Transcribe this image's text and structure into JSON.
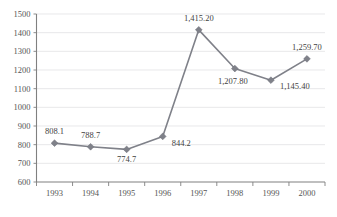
{
  "chart_data": {
    "type": "line",
    "title": "",
    "subtitle": "",
    "xlabel": "",
    "ylabel": "",
    "categories": [
      "1993",
      "1994",
      "1995",
      "1996",
      "1997",
      "1998",
      "1999",
      "2000"
    ],
    "x": [
      "1993",
      "1994",
      "1995",
      "1996",
      "1997",
      "1998",
      "1999",
      "2000"
    ],
    "values": [
      808.1,
      788.7,
      774.7,
      844.2,
      1415.2,
      1207.8,
      1145.4,
      1259.7
    ],
    "data_labels": [
      "808.1",
      "788.7",
      "774.7",
      "844.2",
      "1,415.20",
      "1,207.80",
      "1,145.40",
      "1,259.70"
    ],
    "series": [
      {
        "name": "",
        "values": [
          808.1,
          788.7,
          774.7,
          844.2,
          1415.2,
          1207.8,
          1145.4,
          1259.7
        ]
      }
    ],
    "ylim": [
      600,
      1500
    ],
    "ytick_labels": [
      "1500",
      "1400",
      "1300",
      "1200",
      "1100",
      "1000",
      "900",
      "800",
      "700",
      "600"
    ],
    "ytick_values": [
      1500,
      1400,
      1300,
      1200,
      1100,
      1000,
      900,
      800,
      700,
      600
    ],
    "ytick_step": 100,
    "grid": true,
    "grid_axis": "y",
    "legend": false,
    "legend_position": "none",
    "marker": "diamond",
    "series_color": "#7f8189",
    "grid_color": "#d8d8dc",
    "axis_color": "#808080",
    "label_color": "#3f3f3f",
    "background_color": "#ffffff",
    "annotations": []
  },
  "axes": {
    "y": {
      "ticks": [
        {
          "label": "1500",
          "value": 1500
        },
        {
          "label": "1400",
          "value": 1400
        },
        {
          "label": "1300",
          "value": 1300
        },
        {
          "label": "1200",
          "value": 1200
        },
        {
          "label": "1100",
          "value": 1100
        },
        {
          "label": "1000",
          "value": 1000
        },
        {
          "label": "900",
          "value": 900
        },
        {
          "label": "800",
          "value": 800
        },
        {
          "label": "700",
          "value": 700
        },
        {
          "label": "600",
          "value": 600
        }
      ]
    },
    "x": {
      "ticks": [
        {
          "label": "1993"
        },
        {
          "label": "1994"
        },
        {
          "label": "1995"
        },
        {
          "label": "1996"
        },
        {
          "label": "1997"
        },
        {
          "label": "1998"
        },
        {
          "label": "1999"
        },
        {
          "label": "2000"
        }
      ]
    }
  },
  "points": [
    {
      "label": "808.1",
      "category": "1993",
      "value": 808.1
    },
    {
      "label": "788.7",
      "category": "1994",
      "value": 788.7
    },
    {
      "label": "774.7",
      "category": "1995",
      "value": 774.7
    },
    {
      "label": "844.2",
      "category": "1996",
      "value": 844.2
    },
    {
      "label": "1,415.20",
      "category": "1997",
      "value": 1415.2
    },
    {
      "label": "1,207.80",
      "category": "1998",
      "value": 1207.8
    },
    {
      "label": "1,145.40",
      "category": "1999",
      "value": 1145.4
    },
    {
      "label": "1,259.70",
      "category": "2000",
      "value": 1259.7
    }
  ]
}
